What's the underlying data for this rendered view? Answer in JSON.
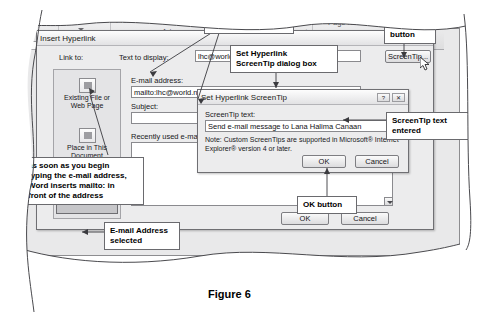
{
  "figure": {
    "caption": "Figure 6"
  },
  "ribbon": {
    "tabs": [
      {
        "label": "Table"
      },
      {
        "label": "Picture"
      },
      {
        "label": "Art"
      },
      {
        "label": "erence"
      },
      {
        "label": "Page\nNumber"
      },
      {
        "label": "Drop"
      }
    ]
  },
  "hyperlink_dialog": {
    "title": "Insert Hyperlink",
    "link_to_label": "Link to:",
    "text_to_display_label": "Text to display:",
    "text_to_display_value": "lhc@world.net",
    "email_address_label": "E-mail address:",
    "email_address_value": "mailto:lhc@world.net",
    "subject_label": "Subject:",
    "subject_value": "",
    "recently_used_label": "Recently used e-mail addresses:",
    "link_to_items": [
      {
        "label": "Existing File or Web Page",
        "icon": "file-web-icon",
        "selected": false
      },
      {
        "label": "Place in This Document",
        "icon": "document-icon",
        "selected": false
      },
      {
        "label": "E-mail Address",
        "icon": "email-icon",
        "selected": true
      }
    ],
    "screentip_button": "ScreenTip...",
    "ok_button": "OK",
    "cancel_button": "Cancel",
    "help_button": "?",
    "close_button": "✕"
  },
  "screentip_dialog": {
    "title": "Set Hyperlink ScreenTip",
    "screentip_text_label": "ScreenTip text:",
    "screentip_text_value": "Send e-mail message to Lana Halima Canaan",
    "note": "Note: Custom ScreenTips are supported in Microsoft® Internet Explorer® version 4 or later.",
    "ok_button": "OK",
    "cancel_button": "Cancel",
    "help_button": "?",
    "close_button": "✕"
  },
  "callouts": [
    {
      "id": "email-entered-twice",
      "text": "e-mail address\nentered twice"
    },
    {
      "id": "set-hyperlink-screentip-dialog-box",
      "text": "Set Hyperlink\nScreenTip dialog box"
    },
    {
      "id": "screentip-button",
      "text": "ScreenTip\nbutton"
    },
    {
      "id": "screentip-text-entered",
      "text": "ScreenTip text\nentered"
    },
    {
      "id": "mailto-note",
      "text": "as soon as you begin\ntyping the e-mail address,\nWord inserts mailto: in\nfront of the address"
    },
    {
      "id": "ok-button-inner",
      "text": "OK button"
    },
    {
      "id": "email-address-selected",
      "text": "E-mail Address\nselected"
    },
    {
      "id": "ok-button-outer",
      "text": "OK button"
    }
  ],
  "colors": {
    "page_background": "#ffffff",
    "dialog_face": "#ececed",
    "plate_face": "#e9e9ea",
    "border": "#6f6f73",
    "text": "#000000"
  }
}
